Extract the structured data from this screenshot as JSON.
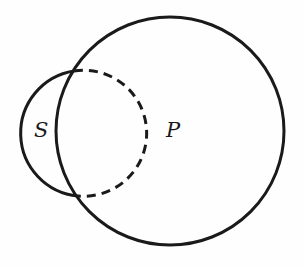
{
  "diagram": {
    "type": "venn",
    "circles": [
      {
        "id": "S",
        "label": "S",
        "cx": 85,
        "cy": 133,
        "r": 63,
        "note": "solid outside P, dashed inside P"
      },
      {
        "id": "P",
        "label": "P",
        "cx": 170,
        "cy": 131,
        "r": 114
      }
    ],
    "labels": {
      "s": "S",
      "p": "P"
    },
    "stroke_color": "#1a1a1a"
  }
}
